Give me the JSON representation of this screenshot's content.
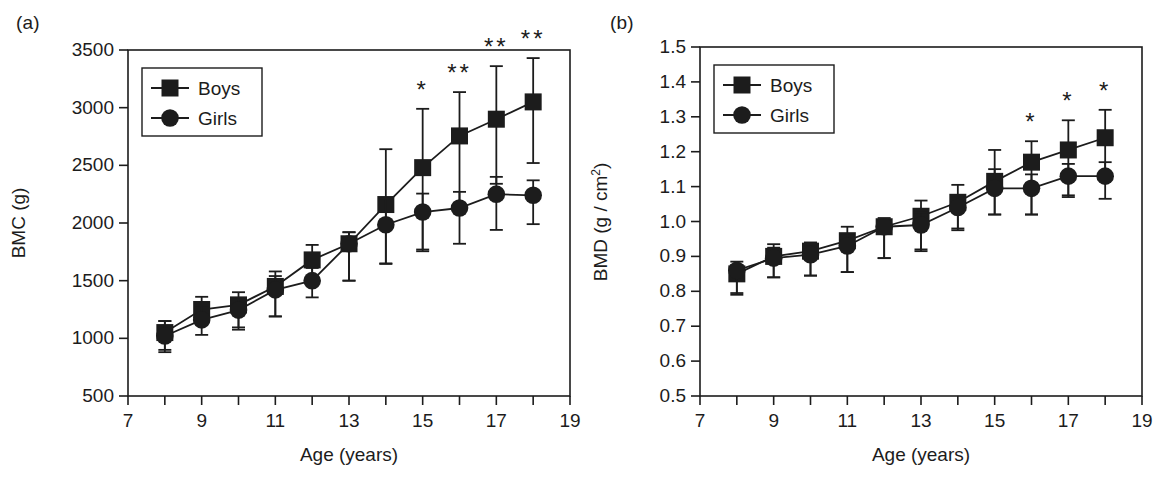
{
  "figure": {
    "width": 1171,
    "height": 488,
    "background": "#ffffff",
    "ink_color": "#1c1c1c"
  },
  "panels": [
    {
      "label": "(a)",
      "xlabel": "Age (years)",
      "ylabel_main": "BMC (g)",
      "ylabel_sup": ""
    },
    {
      "label": "(b)",
      "xlabel": "Age (years)",
      "ylabel_main": "BMD (g / cm",
      "ylabel_sup": "2"
    }
  ],
  "chart_data": [
    {
      "type": "line",
      "panel": "(a)",
      "title": "",
      "xlabel": "Age (years)",
      "ylabel": "BMC (g)",
      "xlim": [
        7,
        19
      ],
      "ylim": [
        500,
        3500
      ],
      "xticks": [
        7,
        8,
        9,
        10,
        11,
        12,
        13,
        14,
        15,
        16,
        17,
        18,
        19
      ],
      "xtick_labels": [
        "7",
        "",
        "9",
        "",
        "11",
        "",
        "13",
        "",
        "15",
        "",
        "17",
        "",
        "19"
      ],
      "yticks": [
        500,
        1000,
        1500,
        2000,
        2500,
        3000,
        3500
      ],
      "ytick_labels": [
        "500",
        "1000",
        "1500",
        "2000",
        "2500",
        "3000",
        "3500"
      ],
      "grid": false,
      "legend_position": "upper-left",
      "x": [
        8,
        9,
        10,
        11,
        12,
        13,
        14,
        15,
        16,
        17,
        18
      ],
      "series": [
        {
          "name": "Boys",
          "marker": "square",
          "color": "#1c1c1c",
          "values": [
            1050,
            1250,
            1290,
            1450,
            1680,
            1820,
            2160,
            2480,
            2755,
            2900,
            3050
          ],
          "err_low": [
            170,
            130,
            195,
            260,
            205,
            320,
            510,
            710,
            640,
            560,
            530
          ],
          "err_high": [
            100,
            110,
            110,
            130,
            130,
            100,
            480,
            510,
            380,
            460,
            380
          ]
        },
        {
          "name": "Girls",
          "marker": "circle",
          "color": "#1c1c1c",
          "values": [
            1020,
            1160,
            1245,
            1420,
            1500,
            1820,
            1985,
            2095,
            2130,
            2250,
            2240
          ],
          "err_low": [
            120,
            130,
            170,
            230,
            145,
            320,
            340,
            340,
            310,
            310,
            250
          ],
          "err_high": [
            130,
            120,
            95,
            120,
            110,
            100,
            230,
            160,
            140,
            150,
            130
          ]
        }
      ],
      "annotations": [
        {
          "x": 15,
          "text": "*"
        },
        {
          "x": 16,
          "text": "**"
        },
        {
          "x": 17,
          "text": "**"
        },
        {
          "x": 18,
          "text": "**"
        }
      ]
    },
    {
      "type": "line",
      "panel": "(b)",
      "title": "",
      "xlabel": "Age (years)",
      "ylabel": "BMD (g / cm2)",
      "xlim": [
        7,
        19
      ],
      "ylim": [
        0.5,
        1.5
      ],
      "xticks": [
        7,
        8,
        9,
        10,
        11,
        12,
        13,
        14,
        15,
        16,
        17,
        18,
        19
      ],
      "xtick_labels": [
        "7",
        "",
        "9",
        "",
        "11",
        "",
        "13",
        "",
        "15",
        "",
        "17",
        "",
        "19"
      ],
      "yticks": [
        0.5,
        0.6,
        0.7,
        0.8,
        0.9,
        1.0,
        1.1,
        1.2,
        1.3,
        1.4,
        1.5
      ],
      "ytick_labels": [
        "0.5",
        "0.6",
        "0.7",
        "0.8",
        "0.9",
        "1.0",
        "1.1",
        "1.2",
        "1.3",
        "1.4",
        "1.5"
      ],
      "grid": false,
      "legend_position": "upper-left",
      "x": [
        8,
        9,
        10,
        11,
        12,
        13,
        14,
        15,
        16,
        17,
        18
      ],
      "series": [
        {
          "name": "Boys",
          "marker": "square",
          "color": "#1c1c1c",
          "values": [
            0.85,
            0.9,
            0.915,
            0.945,
            0.985,
            1.015,
            1.055,
            1.115,
            1.17,
            1.205,
            1.24
          ],
          "err_low": [
            0.06,
            0.06,
            0.07,
            0.09,
            0.09,
            0.1,
            0.08,
            0.095,
            0.15,
            0.13,
            0.115
          ],
          "err_high": [
            0.025,
            0.035,
            0.025,
            0.04,
            0.025,
            0.045,
            0.05,
            0.09,
            0.06,
            0.085,
            0.08
          ]
        },
        {
          "name": "Girls",
          "marker": "circle",
          "color": "#1c1c1c",
          "values": [
            0.86,
            0.895,
            0.905,
            0.93,
            0.985,
            0.99,
            1.04,
            1.095,
            1.095,
            1.13,
            1.13
          ],
          "err_low": [
            0.065,
            0.055,
            0.06,
            0.075,
            0.09,
            0.07,
            0.06,
            0.075,
            0.075,
            0.06,
            0.065
          ],
          "err_high": [
            0.025,
            0.03,
            0.025,
            0.03,
            0.02,
            0.035,
            0.03,
            0.055,
            0.04,
            0.035,
            0.04
          ]
        }
      ],
      "annotations": [
        {
          "x": 16,
          "text": "*"
        },
        {
          "x": 17,
          "text": "*"
        },
        {
          "x": 18,
          "text": "*"
        }
      ]
    }
  ],
  "legend": {
    "entries": [
      {
        "label": "Boys",
        "marker": "square"
      },
      {
        "label": "Girls",
        "marker": "circle"
      }
    ]
  }
}
